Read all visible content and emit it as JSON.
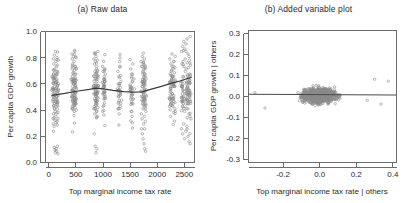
{
  "figure": {
    "background": "#ffffff",
    "point_color": "#8a8a8a",
    "line_color": "#3a3a3a",
    "frame_color": "#6b6b6b"
  },
  "panels": [
    {
      "id": "panel-a",
      "title": "(a) Raw data",
      "xlabel": "Top marginal income tax rate",
      "ylabel": "Per capita GDP growth",
      "xticks": [
        "0",
        "500",
        "1000",
        "1500",
        "2000",
        "2500"
      ],
      "yticks": [
        "0.0",
        "0.2",
        "0.4",
        "0.6",
        "0.8",
        "1.0"
      ]
    },
    {
      "id": "panel-b",
      "title": "(b) Added variable plot",
      "xlabel": "Top marginal income tax rate | others",
      "ylabel": "Per capita GDP growth | others",
      "xticks": [
        "-0.2",
        "0.0",
        "0.2",
        "0.4"
      ],
      "yticks": [
        "-0.3",
        "-0.2",
        "-0.1",
        "0.0",
        "0.1",
        "0.2",
        "0.3"
      ]
    }
  ],
  "chart_data": [
    {
      "type": "scatter",
      "panel": "a",
      "title": "(a) Raw data",
      "xlabel": "Top marginal income tax rate",
      "ylabel": "Per capita GDP growth",
      "xlim": [
        -60,
        2720
      ],
      "ylim": [
        -0.03,
        1.02
      ],
      "xticks": [
        0,
        500,
        1000,
        1500,
        2000,
        2500
      ],
      "yticks": [
        0.0,
        0.2,
        0.4,
        0.6,
        0.8,
        1.0
      ],
      "grid": false,
      "legend": false,
      "marker": "open-circle",
      "note": "Observations fall in discrete vertical bands of the tax-rate variable; a lowess trend line is overlaid.",
      "cluster_centers_x": [
        90,
        160,
        450,
        490,
        870,
        900,
        1030,
        1320,
        1550,
        1760,
        1790,
        2280,
        2330,
        2500,
        2580,
        2630
      ],
      "trend_line": {
        "name": "lowess smoother",
        "x": [
          60,
          300,
          520,
          760,
          880,
          1020,
          1200,
          1400,
          1560,
          1740,
          1900,
          2100,
          2300,
          2450,
          2600,
          2660
        ],
        "y": [
          0.508,
          0.524,
          0.541,
          0.556,
          0.566,
          0.56,
          0.548,
          0.538,
          0.534,
          0.536,
          0.556,
          0.58,
          0.606,
          0.624,
          0.645,
          0.652
        ]
      },
      "series": [
        {
          "name": "countries",
          "x": [
            80,
            85,
            92,
            96,
            100,
            104,
            110,
            112,
            118,
            122,
            128,
            130,
            136,
            140,
            146,
            150,
            152,
            158,
            162,
            166,
            170,
            86,
            94,
            106,
            114,
            124,
            134,
            144,
            154,
            164,
            88,
            98,
            108,
            120,
            132,
            142,
            156,
            168,
            90,
            102,
            116,
            126,
            138,
            148,
            160,
            172,
            82,
            96,
            112,
            130,
            150,
            168,
            84,
            100,
            118,
            138,
            158,
            174,
            430,
            436,
            442,
            448,
            454,
            460,
            466,
            472,
            478,
            484,
            490,
            496,
            502,
            508,
            514,
            520,
            432,
            440,
            450,
            462,
            474,
            486,
            498,
            510,
            438,
            452,
            468,
            482,
            494,
            506,
            518,
            444,
            458,
            476,
            492,
            504,
            516,
            434,
            456,
            470,
            488,
            500,
            512,
            840,
            848,
            856,
            864,
            872,
            880,
            888,
            896,
            904,
            912,
            920,
            844,
            852,
            862,
            874,
            884,
            894,
            906,
            916,
            846,
            858,
            868,
            878,
            890,
            900,
            910,
            918,
            842,
            860,
            876,
            892,
            908,
            914,
            850,
            866,
            882,
            898,
            902,
            1000,
            1010,
            1020,
            1030,
            1040,
            1050,
            1060,
            1005,
            1015,
            1025,
            1035,
            1045,
            1055,
            1008,
            1018,
            1028,
            1038,
            1048,
            1280,
            1300,
            1320,
            1340,
            1360,
            1290,
            1310,
            1330,
            1350,
            1295,
            1315,
            1335,
            1520,
            1540,
            1560,
            1580,
            1600,
            1530,
            1550,
            1570,
            1590,
            1535,
            1555,
            1575,
            1720,
            1730,
            1740,
            1750,
            1760,
            1770,
            1780,
            1790,
            1800,
            1810,
            1820,
            1725,
            1735,
            1745,
            1755,
            1765,
            1775,
            1785,
            1795,
            1805,
            1815,
            1728,
            1742,
            1758,
            1772,
            1788,
            1802,
            1812,
            1732,
            1748,
            1762,
            1778,
            1792,
            1808,
            2250,
            2270,
            2290,
            2310,
            2330,
            2350,
            2370,
            2260,
            2280,
            2300,
            2320,
            2340,
            2360,
            2255,
            2275,
            2295,
            2315,
            2335,
            2355,
            2265,
            2285,
            2305,
            2325,
            2345,
            2470,
            2490,
            2510,
            2530,
            2550,
            2570,
            2590,
            2610,
            2630,
            2650,
            2480,
            2500,
            2520,
            2540,
            2560,
            2580,
            2600,
            2620,
            2640,
            2475,
            2495,
            2515,
            2535,
            2555,
            2575,
            2595,
            2615,
            2635,
            2655,
            2485,
            2505,
            2525,
            2545,
            2565,
            2585,
            2605,
            2625,
            2645,
            2478,
            2498,
            2518,
            2538,
            2558,
            2578,
            2598,
            2618,
            2638
          ],
          "y": [
            0.47,
            0.52,
            0.55,
            0.6,
            0.49,
            0.44,
            0.58,
            0.63,
            0.51,
            0.46,
            0.56,
            0.61,
            0.53,
            0.48,
            0.57,
            0.5,
            0.62,
            0.54,
            0.45,
            0.59,
            0.52,
            0.8,
            0.76,
            0.83,
            0.72,
            0.86,
            0.78,
            0.74,
            0.81,
            0.7,
            0.36,
            0.33,
            0.4,
            0.38,
            0.34,
            0.42,
            0.3,
            0.37,
            0.22,
            0.09,
            0.07,
            0.05,
            0.08,
            0.06,
            0.1,
            0.04,
            0.66,
            0.68,
            0.65,
            0.67,
            0.64,
            0.69,
            0.28,
            0.26,
            0.31,
            0.29,
            0.27,
            0.32,
            0.5,
            0.55,
            0.47,
            0.58,
            0.52,
            0.45,
            0.6,
            0.54,
            0.49,
            0.57,
            0.51,
            0.46,
            0.59,
            0.53,
            0.48,
            0.56,
            0.84,
            0.8,
            0.76,
            0.82,
            0.78,
            0.86,
            0.74,
            0.81,
            0.66,
            0.69,
            0.63,
            0.71,
            0.65,
            0.68,
            0.72,
            0.4,
            0.43,
            0.38,
            0.41,
            0.44,
            0.39,
            0.61,
            0.62,
            0.6,
            0.64,
            0.58,
            0.63,
            0.52,
            0.56,
            0.48,
            0.6,
            0.54,
            0.5,
            0.58,
            0.46,
            0.62,
            0.53,
            0.57,
            0.8,
            0.76,
            0.84,
            0.78,
            0.82,
            0.74,
            0.79,
            0.86,
            0.66,
            0.7,
            0.64,
            0.68,
            0.72,
            0.67,
            0.71,
            0.65,
            0.4,
            0.36,
            0.43,
            0.38,
            0.34,
            0.41,
            0.2,
            0.1,
            0.05,
            0.08,
            0.44,
            0.56,
            0.52,
            0.6,
            0.48,
            0.58,
            0.54,
            0.5,
            0.74,
            0.7,
            0.78,
            0.66,
            0.72,
            0.68,
            0.38,
            0.42,
            0.35,
            0.62,
            0.64,
            0.56,
            0.5,
            0.6,
            0.54,
            0.47,
            0.7,
            0.66,
            0.74,
            0.62,
            0.4,
            0.36,
            0.42,
            0.58,
            0.52,
            0.62,
            0.48,
            0.56,
            0.72,
            0.68,
            0.76,
            0.64,
            0.38,
            0.34,
            0.44,
            0.54,
            0.5,
            0.58,
            0.46,
            0.6,
            0.52,
            0.56,
            0.48,
            0.62,
            0.44,
            0.55,
            0.78,
            0.74,
            0.82,
            0.7,
            0.76,
            0.72,
            0.8,
            0.68,
            0.66,
            0.64,
            0.36,
            0.32,
            0.4,
            0.28,
            0.34,
            0.3,
            0.38,
            0.24,
            0.2,
            0.16,
            0.12,
            0.08,
            0.06,
            0.6,
            0.56,
            0.64,
            0.52,
            0.66,
            0.58,
            0.62,
            0.8,
            0.76,
            0.84,
            0.72,
            0.78,
            0.82,
            0.48,
            0.44,
            0.5,
            0.42,
            0.46,
            0.4,
            0.68,
            0.7,
            0.66,
            0.74,
            0.69,
            0.62,
            0.58,
            0.66,
            0.54,
            0.7,
            0.6,
            0.64,
            0.56,
            0.68,
            0.52,
            0.86,
            0.9,
            0.94,
            0.88,
            0.92,
            0.96,
            0.84,
            0.82,
            0.98,
            0.46,
            0.42,
            0.5,
            0.38,
            0.44,
            0.48,
            0.4,
            0.36,
            0.34,
            0.32,
            0.76,
            0.78,
            0.74,
            0.8,
            0.72,
            0.77,
            0.73,
            0.79,
            0.75,
            0.24,
            0.2,
            0.28,
            0.16,
            0.22,
            0.26,
            0.18,
            0.14,
            0.12
          ]
        }
      ]
    },
    {
      "type": "scatter",
      "panel": "b",
      "title": "(b) Added variable plot",
      "xlabel": "Top marginal income tax rate | others",
      "ylabel": "Per capita GDP growth | others",
      "xlim": [
        -0.39,
        0.42
      ],
      "ylim": [
        -0.345,
        0.345
      ],
      "xticks": [
        -0.2,
        0.0,
        0.2,
        0.4
      ],
      "yticks": [
        -0.3,
        -0.2,
        -0.1,
        0.0,
        0.1,
        0.2,
        0.3
      ],
      "grid": false,
      "legend": false,
      "marker": "open-circle",
      "note": "Dense residual cloud centred near the origin; the fitted partial-regression line is essentially flat at y = 0.01.",
      "fit_line": {
        "name": "partial regression line",
        "x": [
          -0.39,
          0.42
        ],
        "y": [
          0.012,
          0.008
        ]
      },
      "n_points": 900,
      "cloud": {
        "x_center": 0.0,
        "x_sd": 0.075,
        "y_center": 0.005,
        "y_sd": 0.035,
        "outliers_x": [
          -0.355,
          -0.3,
          0.26,
          0.3,
          0.335,
          0.375
        ],
        "outliers_y": [
          0.02,
          -0.06,
          -0.02,
          0.09,
          -0.04,
          0.08
        ]
      }
    }
  ]
}
